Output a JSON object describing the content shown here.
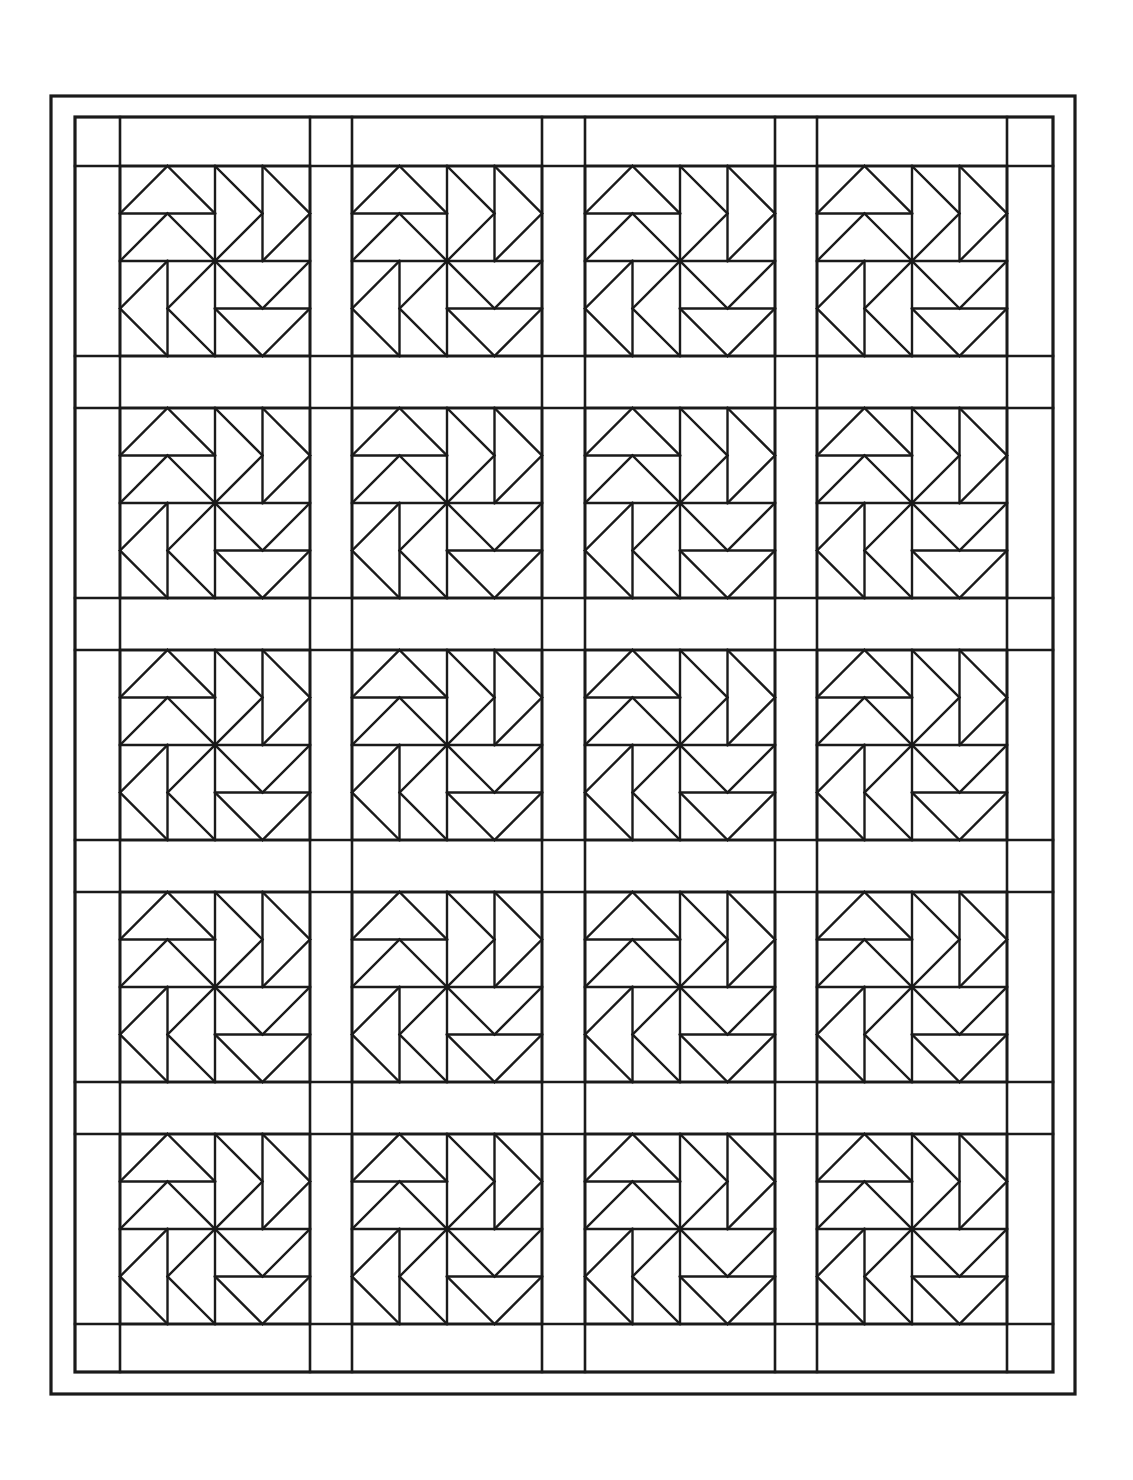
{
  "document": {
    "title": "Quilt Pattern Coloring Page",
    "kind": "line-art-quilt-diagram",
    "page_width": 1133,
    "page_height": 1480,
    "background_color": "#ffffff",
    "line_color": "#1a1a1a"
  },
  "chart_data": {
    "type": "diagram",
    "subtype": "quilt-block-grid",
    "rows": 5,
    "columns": 4,
    "block_count": 20,
    "block_name": "pinwheel-flying-geese",
    "block_cells": 4,
    "sashing": true,
    "border_count": 2
  },
  "geometry": {
    "outer_frame": {
      "x": 51,
      "y": 96,
      "width": 1024,
      "height": 1298,
      "stroke": 3
    },
    "inner_frame": {
      "x": 75,
      "y": 117,
      "width": 978,
      "height": 1255,
      "stroke": 3
    },
    "sashing_color": "#ffffff",
    "columns": [
      {
        "index": 0,
        "x": 120,
        "width": 190
      },
      {
        "index": 1,
        "x": 352,
        "width": 190
      },
      {
        "index": 2,
        "x": 585,
        "width": 190
      },
      {
        "index": 3,
        "x": 817,
        "width": 190
      }
    ],
    "rows": [
      {
        "index": 0,
        "y": 166,
        "height": 190
      },
      {
        "index": 1,
        "y": 408,
        "height": 190
      },
      {
        "index": 2,
        "y": 650,
        "height": 190
      },
      {
        "index": 3,
        "y": 892,
        "height": 190
      },
      {
        "index": 4,
        "y": 1134,
        "height": 190
      }
    ],
    "border_strip_left": 45,
    "border_strip_top": 49,
    "stroke_width_block": 2.6,
    "stroke_width_triangle": 2.4,
    "stroke_width_frame": 3.2
  },
  "block": {
    "name": "pinwheel-block",
    "cells_per_side": 4,
    "description": "Four flying-geese pairs pinwheeling around the block center.",
    "quadrant_lines": [
      "top-left 2x2: large triangle apex up spanning two cells, plus second triangle apex up below",
      "top-right 2x2: two triangles pointing right, stacked, with vertical divider",
      "bottom-left 2x2: two triangles pointing left, stacked, with vertical divider",
      "bottom-right 2x2: large triangle apex down spanning two cells, plus second triangle apex down above"
    ]
  }
}
